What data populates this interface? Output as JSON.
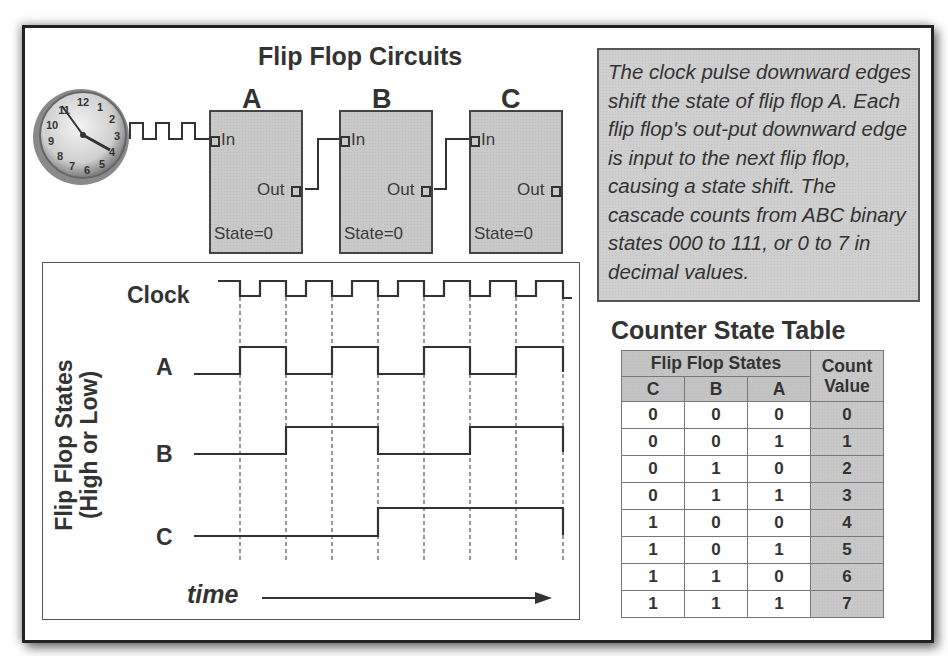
{
  "title": "Flip Flop Circuits",
  "clock_icon": "wall-clock-icon",
  "flip_flops": [
    {
      "letter": "A",
      "in_label": "In",
      "out_label": "Out",
      "state": "State=0"
    },
    {
      "letter": "B",
      "in_label": "In",
      "out_label": "Out",
      "state": "State=0"
    },
    {
      "letter": "C",
      "in_label": "In",
      "out_label": "Out",
      "state": "State=0"
    }
  ],
  "note": "The clock pulse downward edges shift the state of flip flop A. Each flip flop's out-put downward edge is input to the next flip flop, causing a state shift. The cascade counts from ABC binary states 000 to 111, or 0 to 7 in decimal values.",
  "timing": {
    "y_axis_line1": "Flip Flop States",
    "y_axis_line2": "(High or Low)",
    "signals": [
      "Clock",
      "A",
      "B",
      "C"
    ],
    "x_label": "time",
    "waveforms": {
      "A": [
        0,
        1,
        0,
        1,
        0,
        1,
        0,
        1
      ],
      "B": [
        0,
        0,
        1,
        1,
        0,
        0,
        1,
        1
      ],
      "C": [
        0,
        0,
        0,
        0,
        1,
        1,
        1,
        1
      ]
    }
  },
  "table": {
    "title": "Counter State Table",
    "group_header": "Flip Flop States",
    "count_header_1": "Count",
    "count_header_2": "Value",
    "columns": [
      "C",
      "B",
      "A"
    ],
    "rows": [
      [
        "0",
        "0",
        "0",
        "0"
      ],
      [
        "0",
        "0",
        "1",
        "1"
      ],
      [
        "0",
        "1",
        "0",
        "2"
      ],
      [
        "0",
        "1",
        "1",
        "3"
      ],
      [
        "1",
        "0",
        "0",
        "4"
      ],
      [
        "1",
        "0",
        "1",
        "5"
      ],
      [
        "1",
        "1",
        "0",
        "6"
      ],
      [
        "1",
        "1",
        "1",
        "7"
      ]
    ]
  },
  "colors": {
    "box_fill": "#c9c9c9",
    "line": "#333333",
    "frame": "#222222"
  }
}
